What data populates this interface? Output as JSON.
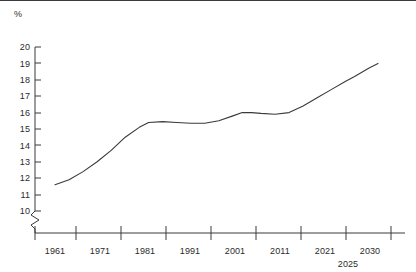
{
  "chart_data": {
    "type": "line",
    "title": "",
    "subtitle": "",
    "xlabel": "",
    "ylabel": "%",
    "y_axis_unit": "%",
    "grid": false,
    "legend": "none",
    "axis_break": true,
    "axis_break_note": "y-axis broken between 0 and 10",
    "xlim": [
      1956,
      2035
    ],
    "ylim": [
      10,
      20
    ],
    "ytick_labels": [
      "20",
      "19",
      "18",
      "17",
      "16",
      "15",
      "14",
      "13",
      "12",
      "11",
      "10"
    ],
    "ytick_values": [
      20,
      19,
      18,
      17,
      16,
      15,
      14,
      13,
      12,
      11,
      10
    ],
    "xtick_labels": [
      "1961",
      "1971",
      "1981",
      "1991",
      "2001",
      "2011",
      "2021",
      "2030"
    ],
    "xtick_secondary_labels": [
      "2025"
    ],
    "series": [
      {
        "name": "percentage",
        "x": [
          1961,
          1964,
          1967,
          1970,
          1973,
          1976,
          1979,
          1981,
          1984,
          1987,
          1990,
          1993,
          1996,
          1999,
          2001,
          2003,
          2005,
          2008,
          2011,
          2014,
          2017,
          2020,
          2023,
          2025,
          2028,
          2030
        ],
        "values": [
          11.6,
          11.9,
          12.4,
          13.0,
          13.7,
          14.5,
          15.1,
          15.4,
          15.45,
          15.4,
          15.35,
          15.35,
          15.5,
          15.8,
          16.0,
          16.0,
          15.95,
          15.9,
          16.0,
          16.4,
          16.9,
          17.4,
          17.9,
          18.2,
          18.7,
          19.0
        ]
      }
    ]
  },
  "axes": {
    "y_unit_label": "%",
    "ticks_y": [
      {
        "label": "20"
      },
      {
        "label": "19"
      },
      {
        "label": "18"
      },
      {
        "label": "17"
      },
      {
        "label": "16"
      },
      {
        "label": "15"
      },
      {
        "label": "14"
      },
      {
        "label": "13"
      },
      {
        "label": "12"
      },
      {
        "label": "11"
      },
      {
        "label": "10"
      }
    ],
    "ticks_x": [
      {
        "label": "1961"
      },
      {
        "label": "1971"
      },
      {
        "label": "1981"
      },
      {
        "label": "1991"
      },
      {
        "label": "2001"
      },
      {
        "label": "2011"
      },
      {
        "label": "2021"
      },
      {
        "label": "2030"
      }
    ],
    "ticks_x_secondary": [
      {
        "label": "2025"
      }
    ]
  },
  "style": {
    "line_color": "#3a3a3a",
    "axis_color": "#3a3a3a",
    "text_color": "#2b2b2b",
    "background": "#ffffff"
  }
}
